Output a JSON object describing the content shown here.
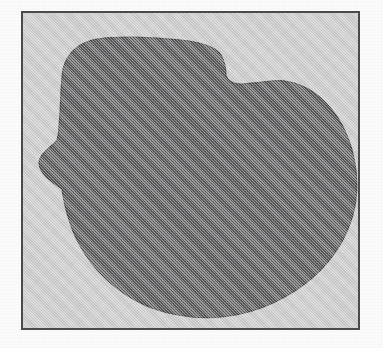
{
  "figure": {
    "kind": "scanned-shape-figure",
    "caption": "",
    "label": "",
    "alt_description": "Dark gray irregular blob silhouette inside a thin rectangular frame on a light gray field"
  },
  "canvas": {
    "width": 383,
    "height": 348,
    "outside_color": "#fbfbfb"
  },
  "frame": {
    "name": "figure-border",
    "x": 21,
    "y": 11,
    "width": 339,
    "height": 319,
    "border_color": "#4a4a4c",
    "border_width": 2,
    "field_color": "#c9c9c9"
  },
  "shape": {
    "name": "irregular-blob",
    "fill_color": "#59595b",
    "outline_color": "#3f3f41",
    "features": [
      "rounded top-left shoulder",
      "gently sloping flat-ish top edge",
      "step notch on upper right",
      "broad convex right bulge",
      "concave pinch notch on left side",
      "wide rounded bottom"
    ],
    "bounds": {
      "min_x": 16,
      "min_y": 24,
      "max_x": 333,
      "max_y": 306
    },
    "path": "M 40 56 C 44 40 56 29 74 26 C 96 23 128 24 158 27 C 178 29 192 33 198 42 C 202 49 203 57 203 63 C 205 68 210 71 217 71 C 228 71 238 69 248 68 C 268 66 288 74 303 90 C 320 108 330 132 333 158 C 336 184 330 210 317 232 C 302 257 278 277 250 290 C 220 304 186 308 155 302 C 126 297 100 283 80 263 C 62 245 50 223 44 200 C 41 190 40 182 39 176 C 33 172 25 167 20 160 C 15 153 15 147 19 142 C 24 136 30 132 34 127 C 36 122 36 112 37 100 C 38 82 38 68 40 56 Z"
  },
  "colors": {
    "blob": "#59595b",
    "field": "#c9c9c9",
    "border": "#4a4a4c",
    "page": "#fbfbfb"
  }
}
